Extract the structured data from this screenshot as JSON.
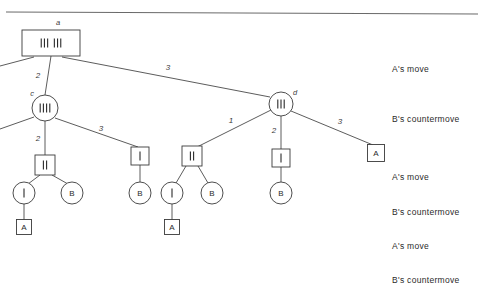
{
  "figure": {
    "type": "game-tree"
  },
  "colors": {
    "line": "#4a4a4a",
    "text": "#2a2a2a",
    "background": "#ffffff",
    "rule": "#6a6a6a"
  },
  "row_labels": [
    {
      "id": "row-a-move-1",
      "text": "A's move",
      "x": 392,
      "y": 64
    },
    {
      "id": "row-b-counter-1",
      "text": "B's countermove",
      "x": 392,
      "y": 114
    },
    {
      "id": "row-a-move-2",
      "text": "A's move",
      "x": 392,
      "y": 172
    },
    {
      "id": "row-b-counter-2",
      "text": "B's countermove",
      "x": 392,
      "y": 207
    },
    {
      "id": "row-a-move-3",
      "text": "A's move",
      "x": 392,
      "y": 241
    },
    {
      "id": "row-b-counter-3",
      "text": "B's countermove",
      "x": 392,
      "y": 275
    }
  ],
  "nodes": [
    {
      "id": "root",
      "shape": "rect",
      "label": "a",
      "tallies": 6,
      "tally_groups": [
        3,
        3
      ],
      "cx": 51,
      "cy": 43,
      "w": 58,
      "h": 26,
      "id_dx": 7,
      "id_dy": -18
    },
    {
      "id": "c",
      "shape": "circle",
      "label": "c",
      "tallies": 4,
      "cx": 45,
      "cy": 108,
      "r": 13,
      "id_dx": -13,
      "id_dy": -12
    },
    {
      "id": "d",
      "shape": "circle",
      "label": "d",
      "tallies": 3,
      "cx": 281,
      "cy": 104,
      "r": 12,
      "id_dx": 14,
      "id_dy": -9
    },
    {
      "id": "e",
      "shape": "rect",
      "tallies": 2,
      "cx": 45,
      "cy": 165,
      "w": 20,
      "h": 20
    },
    {
      "id": "f",
      "shape": "rect",
      "tallies": 1,
      "cx": 140,
      "cy": 156,
      "w": 18,
      "h": 18
    },
    {
      "id": "g",
      "shape": "rect",
      "tallies": 2,
      "cx": 192,
      "cy": 156,
      "w": 20,
      "h": 20
    },
    {
      "id": "h",
      "shape": "rect",
      "tallies": 1,
      "cx": 281,
      "cy": 158,
      "w": 18,
      "h": 18
    },
    {
      "id": "i",
      "shape": "circle",
      "tallies": 1,
      "cx": 24,
      "cy": 193,
      "r": 11
    },
    {
      "id": "j",
      "shape": "circle",
      "letter": "B",
      "cx": 72,
      "cy": 193,
      "r": 11
    },
    {
      "id": "k",
      "shape": "circle",
      "letter": "B",
      "cx": 140,
      "cy": 193,
      "r": 11
    },
    {
      "id": "l",
      "shape": "circle",
      "tallies": 1,
      "cx": 172,
      "cy": 193,
      "r": 11
    },
    {
      "id": "m",
      "shape": "circle",
      "letter": "B",
      "cx": 212,
      "cy": 193,
      "r": 11
    },
    {
      "id": "n",
      "shape": "circle",
      "letter": "B",
      "cx": 281,
      "cy": 193,
      "r": 11
    },
    {
      "id": "o",
      "shape": "rect",
      "letter": "A",
      "cx": 24,
      "cy": 227,
      "w": 15,
      "h": 15
    },
    {
      "id": "p",
      "shape": "rect",
      "letter": "A",
      "cx": 172,
      "cy": 227,
      "w": 15,
      "h": 15
    },
    {
      "id": "q",
      "shape": "rect",
      "letter": "A",
      "cx": 376,
      "cy": 153,
      "w": 17,
      "h": 17
    }
  ],
  "edges": [
    {
      "id": "root-c",
      "x1": 51,
      "y1": 56,
      "x2": 45,
      "y2": 95,
      "label": "2",
      "lx": 38,
      "ly": 78
    },
    {
      "id": "root-d",
      "x1": 62,
      "y1": 57,
      "x2": 270,
      "y2": 97,
      "label": "3",
      "lx": 168,
      "ly": 70
    },
    {
      "id": "root-left-cut",
      "x1": 34,
      "y1": 57,
      "x2": 0,
      "y2": 66,
      "label": "",
      "lx": 0,
      "ly": 0
    },
    {
      "id": "c-e",
      "x1": 45,
      "y1": 121,
      "x2": 45,
      "y2": 155,
      "label": "2",
      "lx": 38,
      "ly": 141
    },
    {
      "id": "c-f",
      "x1": 55,
      "y1": 118,
      "x2": 138,
      "y2": 147,
      "label": "3",
      "lx": 101,
      "ly": 131
    },
    {
      "id": "c-left-cut",
      "x1": 34,
      "y1": 117,
      "x2": 0,
      "y2": 129,
      "label": "",
      "lx": 0,
      "ly": 0
    },
    {
      "id": "d-g",
      "x1": 271,
      "y1": 110,
      "x2": 197,
      "y2": 147,
      "label": "1",
      "lx": 231,
      "ly": 123
    },
    {
      "id": "d-h",
      "x1": 281,
      "y1": 116,
      "x2": 281,
      "y2": 149,
      "label": "2",
      "lx": 274,
      "ly": 133
    },
    {
      "id": "d-q",
      "x1": 291,
      "y1": 111,
      "x2": 373,
      "y2": 145,
      "label": "3",
      "lx": 340,
      "ly": 124
    },
    {
      "id": "e-i",
      "x1": 40,
      "y1": 175,
      "x2": 28,
      "y2": 184,
      "label": "",
      "lx": 0,
      "ly": 0
    },
    {
      "id": "e-j",
      "x1": 52,
      "y1": 175,
      "x2": 68,
      "y2": 184,
      "label": "",
      "lx": 0,
      "ly": 0
    },
    {
      "id": "f-k",
      "x1": 140,
      "y1": 165,
      "x2": 140,
      "y2": 182,
      "label": "",
      "lx": 0,
      "ly": 0
    },
    {
      "id": "g-l",
      "x1": 186,
      "y1": 166,
      "x2": 176,
      "y2": 183,
      "label": "",
      "lx": 0,
      "ly": 0
    },
    {
      "id": "g-m",
      "x1": 198,
      "y1": 166,
      "x2": 208,
      "y2": 183,
      "label": "",
      "lx": 0,
      "ly": 0
    },
    {
      "id": "h-n",
      "x1": 281,
      "y1": 167,
      "x2": 281,
      "y2": 182,
      "label": "",
      "lx": 0,
      "ly": 0
    },
    {
      "id": "i-o",
      "x1": 24,
      "y1": 204,
      "x2": 24,
      "y2": 220,
      "label": "",
      "lx": 0,
      "ly": 0
    },
    {
      "id": "l-p",
      "x1": 172,
      "y1": 204,
      "x2": 172,
      "y2": 220,
      "label": "",
      "lx": 0,
      "ly": 0
    }
  ],
  "top_rule": {
    "x1": 6,
    "y1": 12,
    "x2": 478,
    "y2": 14
  }
}
